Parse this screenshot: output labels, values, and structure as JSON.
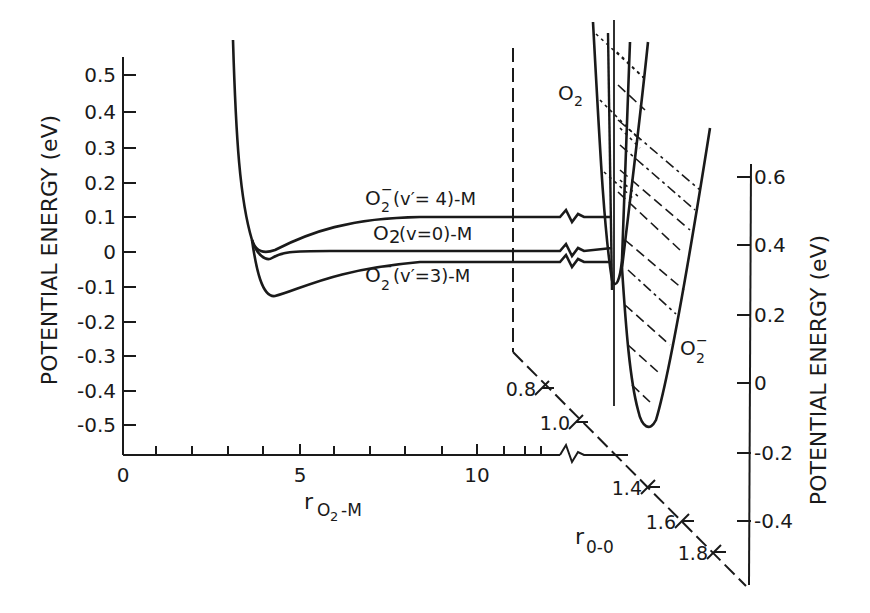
{
  "chart_data": {
    "type": "line",
    "title": "",
    "left_axis": {
      "ylabel": "POTENTIAL ENERGY (eV)",
      "ticks": [
        "0.5",
        "0.4",
        "0.3",
        "0.2",
        "0.1",
        "0",
        "-0.1",
        "-0.2",
        "-0.3",
        "-0.4",
        "-0.5"
      ],
      "ylim": [
        -0.58,
        0.58
      ]
    },
    "bottom_axis": {
      "xlabel": "r",
      "xlabel_sub": "O2 - M",
      "ticks": [
        "0",
        "5",
        "10"
      ],
      "xlim": [
        0,
        13.5
      ],
      "break": true
    },
    "right_axis": {
      "ylabel": "POTENTIAL ENERGY (eV)",
      "ticks": [
        "0.6",
        "0.4",
        "0.2",
        "0",
        "-0.2",
        "-0.4"
      ],
      "ylim": [
        -0.55,
        0.65
      ]
    },
    "diagonal_axis": {
      "xlabel": "r",
      "xlabel_sub": "0-0",
      "ticks": [
        "0.8",
        "1.0",
        "1.4",
        "1.6",
        "1.8"
      ]
    },
    "series": [
      {
        "name": "O2- (v'=4)-M",
        "x": [
          3.3,
          3.6,
          4.0,
          4.5,
          5.5,
          7,
          9,
          11,
          13.4
        ],
        "y": [
          0.55,
          0.1,
          0.0,
          0.02,
          0.06,
          0.09,
          0.1,
          0.1,
          0.1
        ]
      },
      {
        "name": "O2 (v=0)-M",
        "x": [
          3.3,
          3.6,
          4.0,
          4.5,
          5.5,
          7,
          9,
          11,
          13.4
        ],
        "y": [
          0.55,
          0.05,
          -0.02,
          0.0,
          0.0,
          0.0,
          0.0,
          0.0,
          0.0
        ]
      },
      {
        "name": "O2- (v'=3)-M",
        "x": [
          3.3,
          3.6,
          4.0,
          4.5,
          5.5,
          7,
          9,
          11,
          13.4
        ],
        "y": [
          0.55,
          -0.05,
          -0.12,
          -0.1,
          -0.06,
          -0.03,
          -0.02,
          -0.02,
          -0.02
        ]
      },
      {
        "name": "O2",
        "type": "potential_well",
        "minimum_r00": 1.21,
        "minimum_eV": 0.3
      },
      {
        "name": "O2-",
        "type": "potential_well",
        "minimum_r00": 1.35,
        "minimum_eV": -0.12
      }
    ],
    "annotations": [
      "O2- (v'=4)-M",
      "O2 (v=0)-M",
      "O2- (v'=3)-M",
      "O2",
      "O2-"
    ],
    "grid": false,
    "legend": "none (curves labeled inline)"
  },
  "labels": {
    "left_ylabel": "POTENTIAL ENERGY (eV)",
    "right_ylabel": "POTENTIAL ENERGY (eV)",
    "x_main": "r",
    "x_sub": "O",
    "x_sub2": "2",
    "x_suffix": "-M",
    "r00_main": "r",
    "r00_sub": "0-0",
    "curve_v4": {
      "a": "O",
      "b": "2",
      "sup": "−",
      "rest": "(v′= 4)-M"
    },
    "curve_v0": {
      "a": "O",
      "b": "2",
      "rest": " (v=0)-M"
    },
    "curve_v3": {
      "a": "O",
      "b": "2",
      "sup": "−",
      "rest": " (v′=3)-M"
    },
    "o2": {
      "a": "O",
      "b": "2"
    },
    "o2m": {
      "a": "O",
      "b": "2",
      "sup": "−"
    }
  },
  "left_ticks": [
    {
      "t": "0.5",
      "y": 75
    },
    {
      "t": "0.4",
      "y": 112
    },
    {
      "t": "0.3",
      "y": 148
    },
    {
      "t": "0.2",
      "y": 183
    },
    {
      "t": "0.1",
      "y": 217
    },
    {
      "t": "0",
      "y": 252
    },
    {
      "t": "-0.1",
      "y": 287
    },
    {
      "t": "-0.2",
      "y": 322
    },
    {
      "t": "-0.3",
      "y": 356
    },
    {
      "t": "-0.4",
      "y": 391
    },
    {
      "t": "-0.5",
      "y": 425
    }
  ],
  "bottom_ticks": [
    {
      "t": "0",
      "x": 123
    },
    {
      "t": "5",
      "x": 300
    },
    {
      "t": "10",
      "x": 477
    }
  ],
  "right_ticks": [
    {
      "t": "0.6",
      "y": 177
    },
    {
      "t": "0.4",
      "y": 245
    },
    {
      "t": "0.2",
      "y": 315
    },
    {
      "t": "0",
      "y": 383
    },
    {
      "t": "-0.2",
      "y": 453
    },
    {
      "t": "-0.4",
      "y": 521
    }
  ],
  "diag_ticks": [
    {
      "t": "0.8",
      "x": 542,
      "y": 388
    },
    {
      "t": "1.0",
      "x": 576,
      "y": 422
    },
    {
      "t": "1.4",
      "x": 648,
      "y": 487
    },
    {
      "t": "1.6",
      "x": 682,
      "y": 521
    },
    {
      "t": "1.8",
      "x": 714,
      "y": 552
    }
  ]
}
